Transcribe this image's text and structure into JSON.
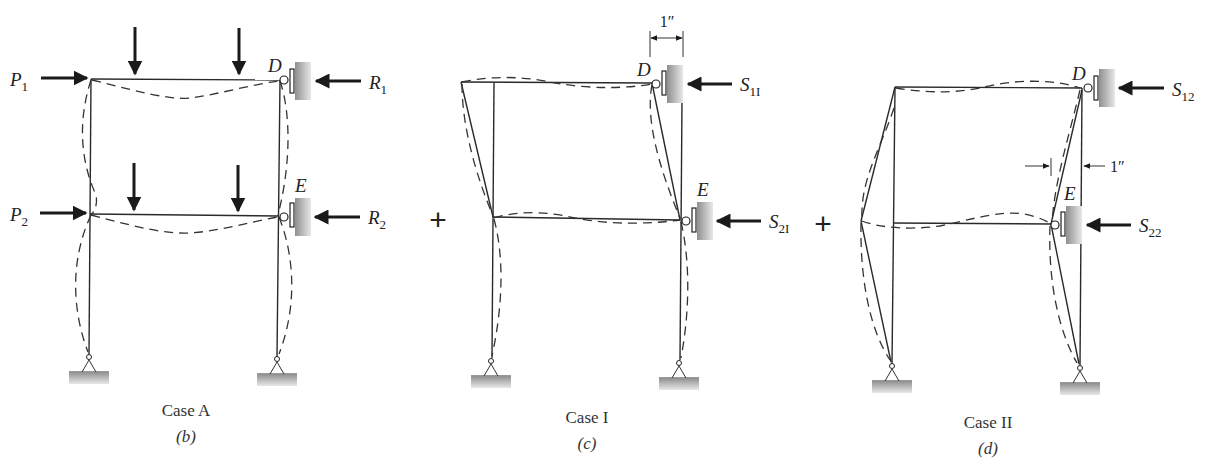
{
  "figure": {
    "panels": [
      {
        "id": "b",
        "case_label": "Case A",
        "sub_label": "(b)",
        "joint_top": "D",
        "joint_bottom": "E",
        "applied_loads": [
          {
            "name": "P",
            "sub": "1"
          },
          {
            "name": "P",
            "sub": "2"
          }
        ],
        "reactions": [
          {
            "name": "R",
            "sub": "1"
          },
          {
            "name": "R",
            "sub": "2"
          }
        ]
      },
      {
        "id": "c",
        "case_label": "Case I",
        "sub_label": "(c)",
        "joint_top": "D",
        "joint_bottom": "E",
        "dimension": "1″",
        "reactions": [
          {
            "name": "S",
            "sub": "1I"
          },
          {
            "name": "S",
            "sub": "2I"
          }
        ]
      },
      {
        "id": "d",
        "case_label": "Case II",
        "sub_label": "(d)",
        "joint_top": "D",
        "joint_bottom": "E",
        "dimension": "1″",
        "reactions": [
          {
            "name": "S",
            "sub": "12"
          },
          {
            "name": "S",
            "sub": "22"
          }
        ]
      }
    ],
    "operators": [
      "+",
      "+"
    ],
    "colors": {
      "line": "#2a2a2a",
      "wall_dark": "#9a9a9a",
      "wall_light": "#e6e6e6",
      "background": "#ffffff"
    }
  }
}
